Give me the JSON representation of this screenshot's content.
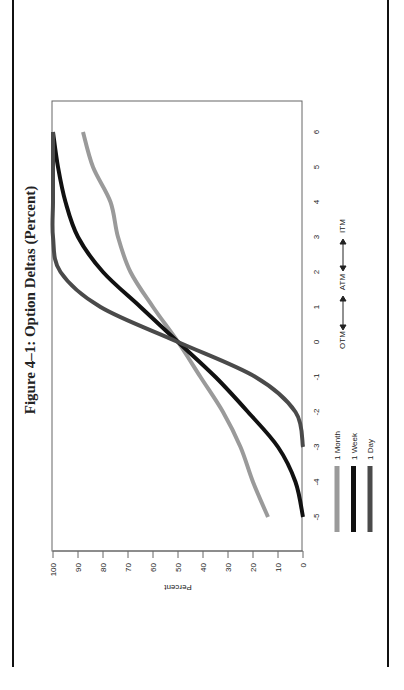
{
  "title": "Figure 4–1: Option Deltas (Percent)",
  "orientation": "rotated 90° counter-clockwise",
  "axes": {
    "y_label": "Percent",
    "y_ticks": [
      "100",
      "90",
      "80",
      "70",
      "60",
      "50",
      "40",
      "30",
      "20",
      "10",
      "0"
    ],
    "x_ticks": [
      "-5",
      "-4",
      "-3",
      "-2",
      "-1",
      "0",
      "1",
      "2",
      "3",
      "4",
      "5",
      "6"
    ],
    "x_annotation": {
      "otm": "OTM",
      "atm": "ATM",
      "itm": "ITM"
    }
  },
  "legend": [
    {
      "label": "1 Month",
      "color": "#9a9a9a"
    },
    {
      "label": "1 Week",
      "color": "#111111"
    },
    {
      "label": "1 Day",
      "color": "#4a4a4a"
    }
  ],
  "chart_data": {
    "type": "line",
    "title": "Figure 4–1: Option Deltas (Percent)",
    "xlabel": "OTM ← → ATM ← → ITM",
    "ylabel": "Percent",
    "x": [
      -5,
      -4,
      -3,
      -2,
      -1,
      0,
      1,
      2,
      3,
      4,
      5,
      6
    ],
    "xlim": [
      -5,
      6
    ],
    "ylim": [
      0,
      100
    ],
    "grid": false,
    "legend_position": "bottom",
    "series": [
      {
        "name": "1 Month",
        "color": "#9a9a9a",
        "values": [
          14,
          20,
          25,
          32,
          41,
          50,
          60,
          69,
          74,
          77,
          84,
          88
        ]
      },
      {
        "name": "1 Week",
        "color": "#111111",
        "values": [
          0,
          3,
          10,
          22,
          35,
          50,
          65,
          80,
          90,
          95,
          98,
          100
        ]
      },
      {
        "name": "1 Day",
        "color": "#4a4a4a",
        "values": [
          null,
          null,
          0,
          3,
          19,
          50,
          81,
          97,
          100,
          100,
          100,
          100
        ]
      }
    ]
  }
}
